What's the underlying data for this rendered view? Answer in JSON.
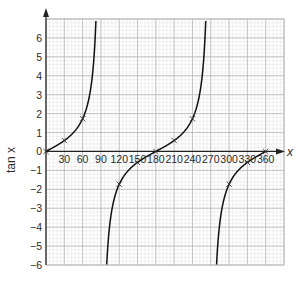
{
  "chart_data": {
    "type": "line",
    "title": "",
    "xlabel": "x",
    "ylabel": "tan x",
    "xlim": [
      0,
      390
    ],
    "ylim": [
      -6,
      7
    ],
    "x_ticks": [
      30,
      60,
      90,
      120,
      150,
      180,
      210,
      240,
      270,
      300,
      330,
      360
    ],
    "y_ticks": [
      -6,
      -5,
      -4,
      -3,
      -2,
      -1,
      0,
      1,
      2,
      3,
      4,
      5,
      6
    ],
    "grid": {
      "major_step_x": 30,
      "major_step_y": 1,
      "minor_divisions": 5,
      "on": true
    },
    "asymptotes_x": [
      90,
      270
    ],
    "series": [
      {
        "name": "tan x",
        "function": "tan",
        "domain": [
          0,
          360
        ],
        "color": "#111111"
      }
    ],
    "marked_points": [
      {
        "x": 0,
        "y": 0
      },
      {
        "x": 30,
        "y": 0.58
      },
      {
        "x": 60,
        "y": 1.73
      },
      {
        "x": 120,
        "y": -1.73
      },
      {
        "x": 150,
        "y": -0.58
      },
      {
        "x": 180,
        "y": 0
      },
      {
        "x": 210,
        "y": 0.58
      },
      {
        "x": 240,
        "y": 1.73
      },
      {
        "x": 300,
        "y": -1.73
      },
      {
        "x": 330,
        "y": -0.58
      },
      {
        "x": 360,
        "y": 0
      }
    ],
    "legend": null
  },
  "colors": {
    "major_grid": "#b8b8b8",
    "minor_grid": "#e2e2e2",
    "axis": "#222222",
    "curve": "#111111",
    "marker": "#333333"
  },
  "labels": {
    "x_axis": "x",
    "y_axis": "tan x",
    "origin": "0"
  }
}
